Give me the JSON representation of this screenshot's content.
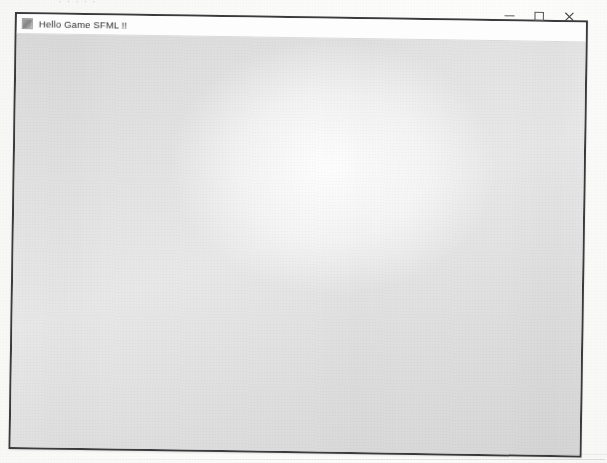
{
  "scan": {
    "cut_off_text_fragment": "· · · · ·",
    "background_color": "#fbfbfa"
  },
  "window": {
    "title": "Hello Game SFML !!",
    "app_icon": "application-icon",
    "frame_color": "#3a3a3c",
    "titlebar_color": "#fdfdfd",
    "client_color": "#e2e2e2",
    "controls": [
      {
        "name": "minimize",
        "glyph": "minimize-icon",
        "tooltip": "Minimize"
      },
      {
        "name": "maximize",
        "glyph": "maximize-icon",
        "tooltip": "Maximize"
      },
      {
        "name": "close",
        "glyph": "close-icon",
        "tooltip": "Close"
      }
    ],
    "client_area": {
      "content": "",
      "description": ""
    }
  }
}
